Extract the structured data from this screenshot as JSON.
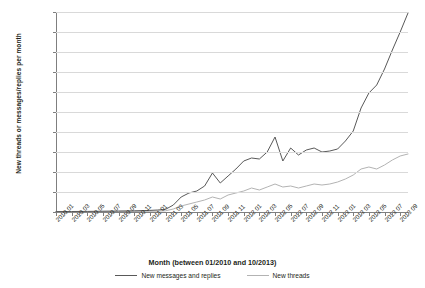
{
  "chart_data": {
    "type": "line",
    "title": "",
    "xlabel": "Month (between 01/2010 and 10/2013)",
    "ylabel": "New threads or messages/replies per month",
    "ylim": [
      0,
      20000
    ],
    "ytick_step": 2000,
    "yticks": [
      "0",
      "2000",
      "4000",
      "6000",
      "8000",
      "10,000",
      "12,000",
      "14,000",
      "16,000",
      "18,000",
      "20,000"
    ],
    "grid": true,
    "legend_position": "bottom",
    "x": [
      "2010 01",
      "2010 02",
      "2010 03",
      "2010 04",
      "2010 05",
      "2010 06",
      "2010 07",
      "2010 08",
      "2010 09",
      "2010 10",
      "2010 11",
      "2010 12",
      "2011 01",
      "2011 02",
      "2011 03",
      "2011 04",
      "2011 05",
      "2011 06",
      "2011 07",
      "2011 08",
      "2011 09",
      "2011 10",
      "2011 11",
      "2011 12",
      "2012 01",
      "2012 02",
      "2012 03",
      "2012 04",
      "2012 05",
      "2012 06",
      "2012 07",
      "2012 08",
      "2012 09",
      "2012 10",
      "2012 11",
      "2012 12",
      "2013 01",
      "2013 02",
      "2013 03",
      "2013 04",
      "2013 05",
      "2013 06",
      "2013 07",
      "2013 08",
      "2013 09",
      "2013 10"
    ],
    "xtick_labels": [
      "2010 01",
      "2010 03",
      "2010 05",
      "2010 07",
      "2010 09",
      "2010 11",
      "2011 01",
      "2011 03",
      "2011 05",
      "2011 07",
      "2011 09",
      "2011 11",
      "2012 01",
      "2012 03",
      "2012 05",
      "2012 07",
      "2012 09",
      "2012 11",
      "2013 01",
      "2013 03",
      "2013 05",
      "2013 07",
      "2013 09"
    ],
    "xtick_label_indices": [
      0,
      2,
      4,
      6,
      8,
      10,
      12,
      14,
      16,
      18,
      20,
      22,
      24,
      26,
      28,
      30,
      32,
      34,
      36,
      38,
      40,
      42,
      44
    ],
    "series": [
      {
        "name": "New messages and replies",
        "color": "#595959",
        "values": [
          40,
          45,
          50,
          55,
          60,
          70,
          80,
          90,
          100,
          110,
          120,
          140,
          160,
          200,
          260,
          700,
          1500,
          1900,
          2100,
          2600,
          3900,
          2900,
          3600,
          4300,
          5100,
          5400,
          5300,
          6000,
          7500,
          5100,
          6400,
          5700,
          6200,
          6400,
          6000,
          6100,
          6300,
          7100,
          8100,
          10400,
          11900,
          12700,
          14300,
          16200,
          18000,
          19900
        ]
      },
      {
        "name": "New threads",
        "color": "#b3b3b3",
        "values": [
          20,
          22,
          25,
          28,
          30,
          35,
          38,
          42,
          45,
          50,
          55,
          60,
          70,
          90,
          120,
          300,
          600,
          800,
          1000,
          1200,
          1500,
          1300,
          1700,
          1900,
          2100,
          2400,
          2200,
          2500,
          2800,
          2500,
          2600,
          2400,
          2600,
          2800,
          2700,
          2800,
          3000,
          3300,
          3700,
          4300,
          4500,
          4300,
          4700,
          5200,
          5600,
          5800
        ]
      }
    ]
  },
  "legend": {
    "items": [
      {
        "label": "New messages and replies"
      },
      {
        "label": "New threads"
      }
    ]
  }
}
